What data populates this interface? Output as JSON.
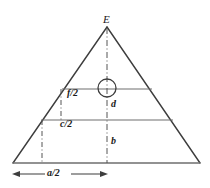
{
  "figure": {
    "caption": "",
    "colors": {
      "stroke": "#3d3d3d",
      "thin_stroke": "#6b6b6b",
      "background": "#ffffff",
      "text": "#1a1a1a"
    },
    "labels": {
      "apex": "E",
      "upper_chord": "f/2",
      "lower_chord": "c/2",
      "upper_depth": "d",
      "lower_depth": "b",
      "base_half": "a/2"
    },
    "geometry": {
      "apex": {
        "x": 107,
        "y": 27
      },
      "base_left": {
        "x": 13,
        "y": 163
      },
      "base_right": {
        "x": 200,
        "y": 163
      },
      "upper_line_y": 89,
      "lower_line_y": 120,
      "upper_line_left_x": 62,
      "upper_line_right_x": 152,
      "lower_line_left_x": 41,
      "lower_line_right_x": 173,
      "circle_center": {
        "x": 107,
        "y": 88
      },
      "circle_radius": 9,
      "tick_upper_x": 61,
      "tick_lower_x": 42,
      "dimension_arrow_y": 174,
      "dimension_arrow_from_x": 13,
      "dimension_arrow_to_x": 107
    }
  }
}
